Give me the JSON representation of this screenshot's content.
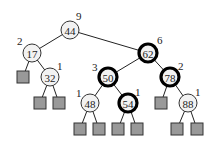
{
  "diagram": {
    "type": "binary-search-tree",
    "nodes": [
      {
        "id": "n44",
        "key": "44",
        "x": 70,
        "y": 30,
        "height": "9",
        "bold": false,
        "lx": 76,
        "ly": 20
      },
      {
        "id": "n17",
        "key": "17",
        "x": 32,
        "y": 53,
        "height": "2",
        "bold": false,
        "lx": 17,
        "ly": 45
      },
      {
        "id": "n62",
        "key": "62",
        "x": 148,
        "y": 53,
        "height": "6",
        "bold": true,
        "lx": 157,
        "ly": 44
      },
      {
        "id": "n32",
        "key": "32",
        "x": 50,
        "y": 77,
        "height": "1",
        "bold": false,
        "lx": 57,
        "ly": 70
      },
      {
        "id": "n50",
        "key": "50",
        "x": 108,
        "y": 77,
        "height": "3",
        "bold": true,
        "lx": 92,
        "ly": 71
      },
      {
        "id": "n78",
        "key": "78",
        "x": 170,
        "y": 77,
        "height": "2",
        "bold": true,
        "lx": 178,
        "ly": 70
      },
      {
        "id": "n48",
        "key": "48",
        "x": 90,
        "y": 103,
        "height": "1",
        "bold": false,
        "lx": 76,
        "ly": 97
      },
      {
        "id": "n54",
        "key": "54",
        "x": 128,
        "y": 103,
        "height": "1",
        "bold": true,
        "lx": 135,
        "ly": 96
      },
      {
        "id": "n88",
        "key": "88",
        "x": 188,
        "y": 103,
        "height": "1",
        "bold": false,
        "lx": 195,
        "ly": 96
      }
    ],
    "leaves": [
      {
        "x": 23,
        "y": 77
      },
      {
        "x": 40,
        "y": 103
      },
      {
        "x": 59,
        "y": 103
      },
      {
        "x": 80,
        "y": 129
      },
      {
        "x": 99,
        "y": 129
      },
      {
        "x": 118,
        "y": 129
      },
      {
        "x": 137,
        "y": 129
      },
      {
        "x": 161,
        "y": 103
      },
      {
        "x": 177,
        "y": 129
      },
      {
        "x": 197,
        "y": 129
      }
    ],
    "edges": [
      [
        "n44",
        "n17"
      ],
      [
        "n44",
        "n62"
      ],
      [
        "n17",
        "L0"
      ],
      [
        "n17",
        "n32"
      ],
      [
        "n32",
        "L1"
      ],
      [
        "n32",
        "L2"
      ],
      [
        "n62",
        "n50"
      ],
      [
        "n62",
        "n78"
      ],
      [
        "n50",
        "n48"
      ],
      [
        "n50",
        "n54"
      ],
      [
        "n48",
        "L3"
      ],
      [
        "n48",
        "L4"
      ],
      [
        "n54",
        "L5"
      ],
      [
        "n54",
        "L6"
      ],
      [
        "n78",
        "L7"
      ],
      [
        "n78",
        "n88"
      ],
      [
        "n88",
        "L8"
      ],
      [
        "n88",
        "L9"
      ]
    ]
  }
}
